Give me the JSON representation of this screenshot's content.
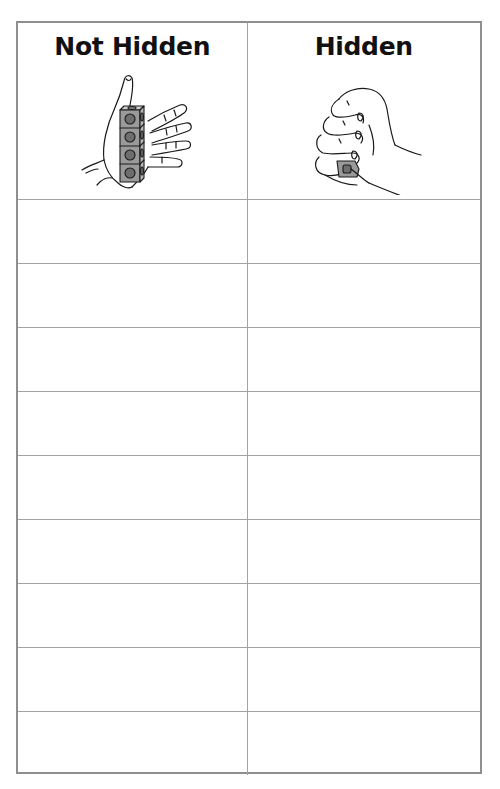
{
  "worksheet": {
    "columns": [
      {
        "title": "Not Hidden",
        "illustration": "open-hand-holding-cube-stack-icon",
        "cube_count": 4
      },
      {
        "title": "Hidden",
        "illustration": "closed-fist-hiding-cubes-icon"
      }
    ],
    "blank_rows": 9,
    "rows": [
      {
        "not_hidden": "",
        "hidden": ""
      },
      {
        "not_hidden": "",
        "hidden": ""
      },
      {
        "not_hidden": "",
        "hidden": ""
      },
      {
        "not_hidden": "",
        "hidden": ""
      },
      {
        "not_hidden": "",
        "hidden": ""
      },
      {
        "not_hidden": "",
        "hidden": ""
      },
      {
        "not_hidden": "",
        "hidden": ""
      },
      {
        "not_hidden": "",
        "hidden": ""
      },
      {
        "not_hidden": "",
        "hidden": ""
      }
    ],
    "colors": {
      "border": "#8f8f8f",
      "grid_line": "#a3a3a3",
      "title_text": "#111111",
      "cube_fill": "#9a9a9a",
      "cube_dot": "#6e6e6e"
    }
  }
}
